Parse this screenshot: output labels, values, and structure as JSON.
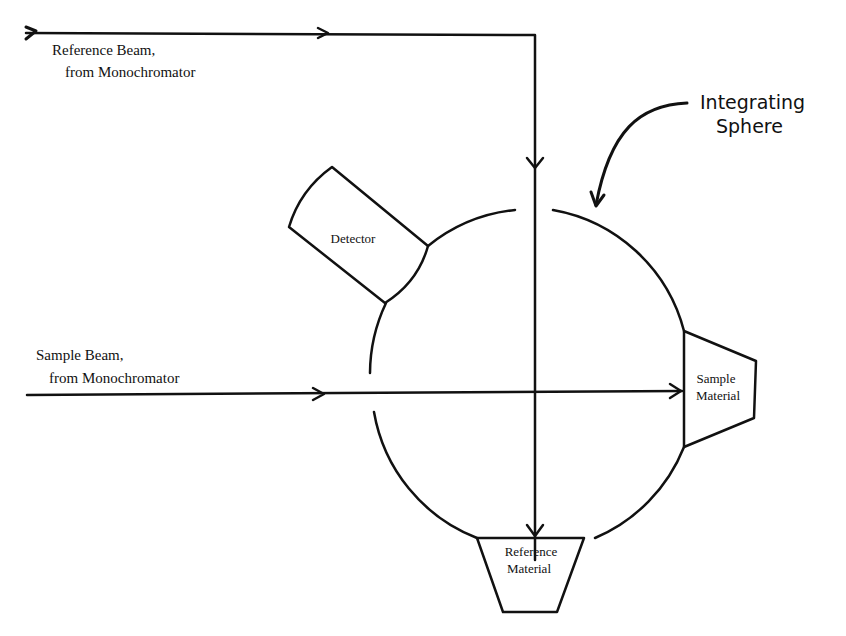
{
  "diagram": {
    "title_label": {
      "line1": "Integrating",
      "line2": "Sphere"
    },
    "reference_beam": {
      "line1": "Reference Beam,",
      "line2": "from Monochromator"
    },
    "sample_beam": {
      "line1": "Sample Beam,",
      "line2": "from Monochromator"
    },
    "detector": {
      "label": "Detector"
    },
    "sample_material": {
      "line1": "Sample",
      "line2": "Material"
    },
    "reference_material": {
      "line1": "Reference",
      "line2": "Material"
    }
  },
  "colors": {
    "line": "#111111",
    "background": "#ffffff"
  }
}
